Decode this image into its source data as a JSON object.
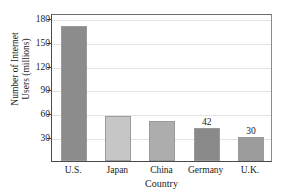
{
  "chart_data": {
    "type": "bar",
    "title": "",
    "xlabel": "Country",
    "ylabel": "Number of Internet Users (millions)",
    "ylabel_line1": "Number of Internet",
    "ylabel_line2": "Users (millions)",
    "categories": [
      "U.S.",
      "Japan",
      "China",
      "Germany",
      "U.K."
    ],
    "values": [
      170,
      57,
      50,
      42,
      30
    ],
    "point_labels": [
      "",
      "",
      "",
      "42",
      "30"
    ],
    "bar_colors": [
      "#8c8c8c",
      "#c6c6c6",
      "#adadad",
      "#898989",
      "#9c9c9c"
    ],
    "ylim": [
      0,
      186
    ],
    "y_ticks": [
      30,
      60,
      90,
      120,
      150,
      180
    ],
    "y_tick_labels": [
      "30",
      "60",
      "90",
      "120",
      "150",
      "180"
    ],
    "grid": true,
    "grid_axis": "y",
    "legend": "none",
    "axis_color": "#4a4a4a",
    "grid_color": "#e3e3e3"
  }
}
